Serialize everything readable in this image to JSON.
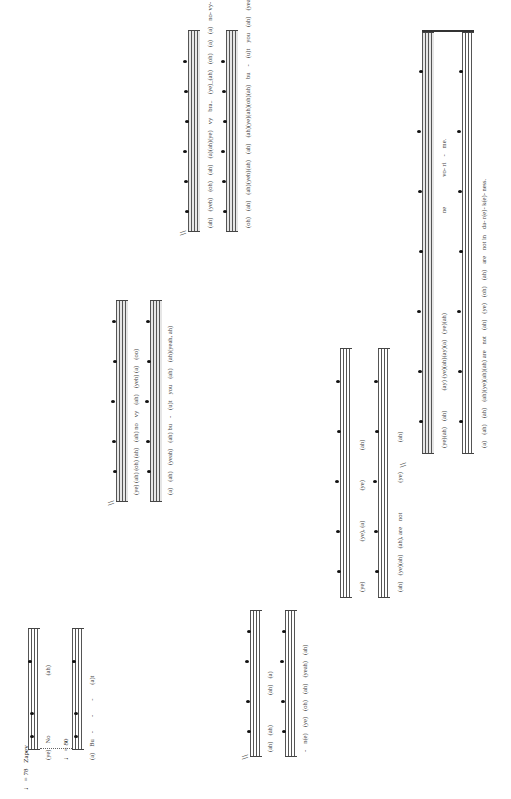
{
  "orientation": "rotated-90-ccw",
  "score": {
    "systems": [
      {
        "id": 1,
        "tempo_top": "♩ = 78",
        "tempo_label": "Zapev",
        "tempo_bottom": "♩ = 80",
        "lyrics_top": [
          "(ye)",
          "No",
          "(ah)"
        ],
        "lyrics_bottom": [
          "(a)",
          "Bu",
          "-",
          "-",
          "-",
          "(a)t"
        ]
      },
      {
        "id": 2,
        "lyrics_top": [
          "(ye) (ah) (oh) (ah)",
          "(ah) no",
          "vy",
          "(ah)",
          "(yeh) (a)",
          "(oo)"
        ],
        "lyrics_bottom": [
          "(a)",
          "(ah)",
          "(yeah)",
          "(ah) bu",
          "-",
          "(u)t",
          "you",
          "(ah)",
          "(ah)(yeah, ah)"
        ]
      },
      {
        "id": 3,
        "lyrics_top": [
          "(ah)",
          "(yeh)",
          "(oh)",
          "(ah)",
          "(a)(ah)(ye)",
          "vy",
          "bra..",
          "(ye)_(ah)",
          "(oh)",
          "(a)",
          "(a)",
          "no- vy- b- ri",
          "-",
          "li",
          "-",
          "ya"
        ],
        "lyrics_bottom": [
          "(oh)",
          "(ah)",
          "(ah)(yeh)(ah)",
          "(ah)",
          "(ah)(ye)(ah)(oh)(ah)",
          "bu",
          "-",
          "(u)t",
          "you",
          "(ah)",
          "(yeah)",
          "(oh)",
          "(ah)",
          "bu- (u)t",
          "you",
          "bro- th(e)",
          "-",
          "re",
          "-"
        ]
      },
      {
        "id": 4,
        "lyrics_top": [
          "(ah)",
          "(ah)",
          "(ah)",
          "(a)"
        ],
        "lyrics_bottom": [
          "-",
          "n(e)",
          "(ye)",
          "(oh)",
          "(ah)",
          "(yeah)",
          "(ah)"
        ]
      },
      {
        "id": 5,
        "lyrics_top": [
          "(ye)",
          "(ye), (a)",
          "(ye)",
          "(ah)"
        ],
        "lyrics_bottom": [
          "(ah)",
          "(ye)(ah)",
          "(ah), are",
          "not",
          "(ye)",
          "(ah)"
        ]
      },
      {
        "id": 6,
        "lyrics_top": [
          "(ye)(ah)",
          "(ah)",
          "(ay) (ye)(ah)(ay)(a)",
          "(ye)(ah)",
          "ne",
          "vo- ri",
          "-",
          "me."
        ],
        "lyrics_bottom": [
          "(a)",
          "(ah)",
          "(ah)",
          "(ah)(ye)(ah)(ah) are",
          "not",
          "(ah)",
          "(ye)",
          "(oh)",
          "(ah)",
          "are",
          "not in",
          "da- r(e)- k(e)- ness."
        ]
      }
    ],
    "section_marker": "\\\\"
  }
}
